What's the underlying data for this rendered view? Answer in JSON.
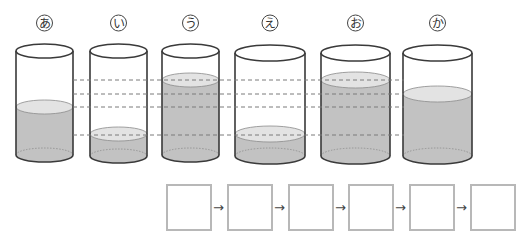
{
  "diagram": {
    "title": "",
    "colors": {
      "water": "#c2c2c2",
      "surface": "#e3e3e3",
      "outline": "#3a3a3a",
      "dashed": "#7a7a7a",
      "box_border": "#b8b8b8"
    },
    "containers": [
      {
        "label": "あ",
        "x": 16,
        "width": 57,
        "top": 51,
        "bottom": 155,
        "water_level": 107,
        "ry": 7
      },
      {
        "label": "い",
        "x": 90,
        "width": 57,
        "top": 51,
        "bottom": 156,
        "water_level": 134,
        "ry": 7
      },
      {
        "label": "う",
        "x": 162,
        "width": 57,
        "top": 51,
        "bottom": 155,
        "water_level": 80,
        "ry": 7
      },
      {
        "label": "え",
        "x": 235,
        "width": 70,
        "top": 53,
        "bottom": 156,
        "water_level": 134,
        "ry": 8
      },
      {
        "label": "お",
        "x": 321,
        "width": 69,
        "top": 53,
        "bottom": 156,
        "water_level": 80,
        "ry": 8
      },
      {
        "label": "か",
        "x": 403,
        "width": 69,
        "top": 53,
        "bottom": 156,
        "water_level": 94,
        "ry": 8
      }
    ],
    "dashed_lines": {
      "x_start": 73,
      "x_end": 404,
      "y_values": [
        80,
        94,
        107,
        135
      ]
    },
    "answer_sequence": {
      "boxes": [
        "",
        "",
        "",
        "",
        "",
        ""
      ],
      "arrow": "→",
      "box_x": [
        166,
        227,
        288,
        348,
        409,
        470
      ],
      "box_y": 184
    }
  }
}
